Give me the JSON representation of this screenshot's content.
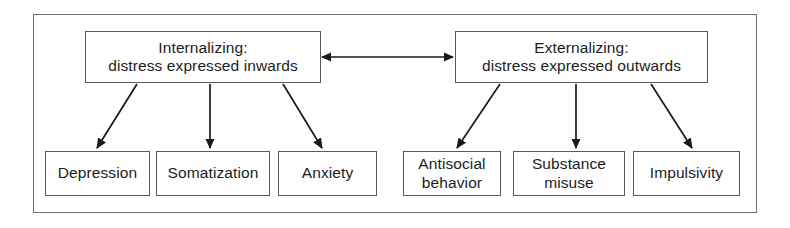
{
  "diagram": {
    "frame": {
      "x": 33,
      "y": 14,
      "width": 724,
      "height": 199
    },
    "colors": {
      "background": "#ffffff",
      "box_border": "#58595b",
      "frame_border": "#6d6e70",
      "text": "#1c1c1c",
      "arrow": "#1a1a1a"
    },
    "top_nodes": [
      {
        "id": "internalizing",
        "label": "Internalizing:\ndistress expressed inwards",
        "x": 85,
        "y": 31,
        "width": 236,
        "height": 52
      },
      {
        "id": "externalizing",
        "label": "Externalizing:\ndistress expressed outwards",
        "x": 455,
        "y": 31,
        "width": 253,
        "height": 52
      }
    ],
    "leaf_nodes": [
      {
        "id": "depression",
        "label": "Depression",
        "parent": "internalizing",
        "x": 45,
        "y": 151,
        "width": 105,
        "height": 45
      },
      {
        "id": "somatization",
        "label": "Somatization",
        "parent": "internalizing",
        "x": 156,
        "y": 151,
        "width": 114,
        "height": 45
      },
      {
        "id": "anxiety",
        "label": "Anxiety",
        "parent": "internalizing",
        "x": 278,
        "y": 151,
        "width": 99,
        "height": 45
      },
      {
        "id": "antisocial-behavior",
        "label": "Antisocial\nbehavior",
        "parent": "externalizing",
        "x": 403,
        "y": 151,
        "width": 98,
        "height": 45
      },
      {
        "id": "substance-misuse",
        "label": "Substance\nmisuse",
        "parent": "externalizing",
        "x": 513,
        "y": 151,
        "width": 112,
        "height": 45
      },
      {
        "id": "impulsivity",
        "label": "Impulsivity",
        "parent": "externalizing",
        "x": 633,
        "y": 151,
        "width": 107,
        "height": 45
      }
    ],
    "connectors": [
      {
        "id": "internalizing-externalizing",
        "type": "double-arrow",
        "from": "internalizing",
        "to": "externalizing",
        "x1": 322,
        "y1": 57,
        "x2": 453,
        "y2": 57
      },
      {
        "id": "internalizing-to-depression",
        "type": "arrow",
        "x1": 137,
        "y1": 84,
        "x2": 97,
        "y2": 148
      },
      {
        "id": "internalizing-to-somatization",
        "type": "arrow",
        "x1": 210,
        "y1": 84,
        "x2": 210,
        "y2": 148
      },
      {
        "id": "internalizing-to-anxiety",
        "type": "arrow",
        "x1": 283,
        "y1": 84,
        "x2": 322,
        "y2": 148
      },
      {
        "id": "externalizing-to-antisocial",
        "type": "arrow",
        "x1": 500,
        "y1": 84,
        "x2": 457,
        "y2": 148
      },
      {
        "id": "externalizing-to-substance",
        "type": "arrow",
        "x1": 576,
        "y1": 84,
        "x2": 576,
        "y2": 148
      },
      {
        "id": "externalizing-to-impulsivity",
        "type": "arrow",
        "x1": 651,
        "y1": 84,
        "x2": 692,
        "y2": 148
      }
    ]
  }
}
